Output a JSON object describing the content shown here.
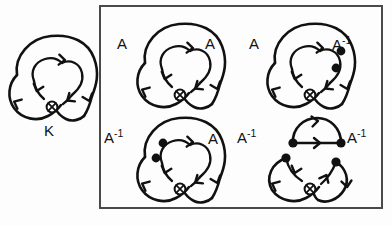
{
  "figure": {
    "background_color": "#fdfdfd",
    "ink_color": "#111111",
    "border_color": "#4a4a4a"
  },
  "source_knot": {
    "label": "K",
    "name": "trefoil-knot-diagram",
    "crossing_count": 1,
    "marker_count": 0
  },
  "panel": {
    "name": "smoothing-states-box",
    "border_width": 2,
    "x": 100,
    "y": 6,
    "width": 282,
    "height": 202
  },
  "states": [
    {
      "id": "state-aa",
      "name": "smoothing-state-top-left",
      "left_label": "A",
      "left_label_sup": "",
      "right_label": "A",
      "right_label_sup": "",
      "marker_count": 0,
      "marker_side": "none"
    },
    {
      "id": "state-a-ainv",
      "name": "smoothing-state-top-right",
      "left_label": "A",
      "left_label_sup": "",
      "right_label": "A",
      "right_label_sup": "-1",
      "marker_count": 2,
      "marker_side": "right"
    },
    {
      "id": "state-ainv-a",
      "name": "smoothing-state-bottom-left",
      "left_label": "A",
      "left_label_sup": "-1",
      "right_label": "A",
      "right_label_sup": "",
      "marker_count": 2,
      "marker_side": "left"
    },
    {
      "id": "state-ainv-ainv",
      "name": "smoothing-state-bottom-right",
      "left_label": "A",
      "left_label_sup": "-1",
      "right_label": "A",
      "right_label_sup": "-1",
      "marker_count": 4,
      "marker_side": "both"
    }
  ]
}
